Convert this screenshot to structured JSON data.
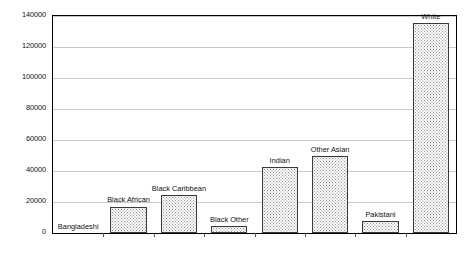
{
  "chart_data": {
    "type": "bar",
    "title": "",
    "subtitle": "",
    "xlabel": "",
    "ylabel": "",
    "ylim": [
      0,
      140000
    ],
    "ytick_labels": [
      "0",
      "20000",
      "40000",
      "60000",
      "80000",
      "100000",
      "120000",
      "140000"
    ],
    "ytick_values": [
      0,
      20000,
      40000,
      60000,
      80000,
      100000,
      120000,
      140000
    ],
    "grid": "horizontal",
    "legend": "none",
    "bar_labels_position": "above-bar",
    "categories": [
      "Bangladeshi",
      "Black African",
      "Black Caribbean",
      "Black Other",
      "Indian",
      "Other Asian",
      "Pakistani",
      "White"
    ],
    "values": [
      0,
      17000,
      24500,
      4500,
      42600,
      49700,
      7700,
      135500
    ],
    "series": [
      {
        "name": "Count",
        "values": [
          0,
          17000,
          24500,
          4500,
          42600,
          49700,
          7700,
          135500
        ]
      }
    ],
    "colors": {
      "bar_fill": "#fdfdfd",
      "bar_pattern": "#8e8e8e",
      "bar_outline": "#3a3a3a",
      "gridline": "#c9c9c9",
      "axis": "#000000",
      "text": "#111111"
    }
  }
}
